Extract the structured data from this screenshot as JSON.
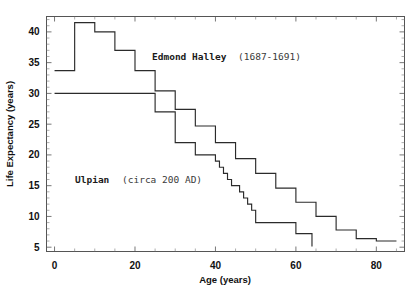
{
  "chart_data": {
    "type": "line",
    "title": "",
    "xlabel": "Age (years)",
    "ylabel": "Life Expectancy (years)",
    "xlim": [
      -2,
      87
    ],
    "ylim": [
      4.3,
      42.5
    ],
    "xticks": [
      0,
      20,
      40,
      60,
      80
    ],
    "xtick_labels": [
      "0",
      "20",
      "40",
      "60",
      "80"
    ],
    "yticks": [
      5,
      10,
      15,
      20,
      25,
      30,
      35,
      40
    ],
    "ytick_labels": [
      "5",
      "10",
      "15",
      "20",
      "25",
      "30",
      "35",
      "40"
    ],
    "xminor_step": 5,
    "yminor_step": 1,
    "grid": false,
    "legend_position": "inline-annotations",
    "series": [
      {
        "name": "Edmond Halley (1687-1691)",
        "label_bold": "Edmond Halley",
        "label_plain": "(1687-1691)",
        "style": "step-post",
        "x": [
          0,
          5,
          10,
          15,
          20,
          25,
          30,
          35,
          40,
          45,
          50,
          55,
          60,
          65,
          70,
          75,
          80,
          85
        ],
        "y": [
          33.7,
          41.5,
          40.0,
          37.0,
          33.7,
          30.4,
          27.4,
          24.7,
          22.0,
          19.4,
          17.0,
          14.6,
          12.3,
          10.0,
          7.8,
          6.4,
          6.0,
          6.0
        ]
      },
      {
        "name": "Ulpian (circa 200 AD)",
        "label_bold": "Ulpian",
        "label_plain": "(circa 200 AD)",
        "style": "step-post",
        "x": [
          0,
          20,
          25,
          30,
          35,
          40,
          41,
          42,
          43,
          44,
          45,
          46,
          47,
          48,
          49,
          50,
          55,
          60,
          64
        ],
        "y": [
          30.0,
          30.0,
          27.0,
          22.0,
          20.0,
          19.0,
          18.0,
          17.0,
          16.0,
          15.0,
          15.0,
          14.0,
          13.0,
          12.0,
          11.0,
          9.0,
          9.0,
          7.2,
          5.1
        ]
      }
    ],
    "annotations": [
      {
        "text": "Edmond Halley (1687-1691)",
        "x": 40,
        "y": 36.2
      },
      {
        "text": "Ulpian (circa 200 AD)",
        "x": 15,
        "y": 15.0
      }
    ]
  }
}
